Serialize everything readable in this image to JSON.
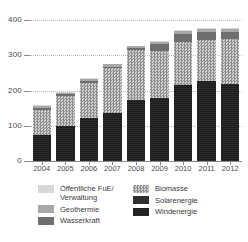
{
  "chart_data": {
    "type": "bar",
    "subtype": "stacked-bar",
    "title": "",
    "xlabel": "",
    "ylabel": "",
    "ylim": [
      0,
      400
    ],
    "yticks": [
      0,
      100,
      200,
      300,
      400
    ],
    "ytick_labels": [
      "0",
      "100",
      "200",
      "300",
      "400"
    ],
    "grid": true,
    "grid_style": "dotted horizontal",
    "legend_position": "bottom",
    "categories": [
      "2004",
      "2005",
      "2006",
      "2007",
      "2008",
      "2009",
      "2010",
      "2011",
      "2012"
    ],
    "series": [
      {
        "name": "Windenergie",
        "color": "#1c1c1c",
        "pattern": "solid-dark",
        "values": [
          73,
          100,
          122,
          136,
          174,
          180,
          217,
          227,
          219
        ]
      },
      {
        "name": "Solarenergie",
        "color": "#2f2f2f",
        "pattern": "solid",
        "values": [
          0,
          0,
          0,
          0,
          0,
          0,
          0,
          0,
          0
        ]
      },
      {
        "name": "Biomasse",
        "color": "#9a9a9a",
        "pattern": "checkered",
        "values": [
          72,
          85,
          100,
          127,
          141,
          131,
          122,
          117,
          126
        ]
      },
      {
        "name": "Wasserkraft",
        "color": "#6e6e6e",
        "pattern": "solid-medium",
        "values": [
          6,
          5,
          6,
          5,
          5,
          20,
          21,
          21,
          21
        ]
      },
      {
        "name": "Geothermie",
        "color": "#a8a8a8",
        "pattern": "solid-light",
        "values": [
          5,
          4,
          5,
          6,
          5,
          7,
          8,
          9,
          9
        ]
      },
      {
        "name": "Öffentliche FuE/Verwaltung",
        "color": "#d8d8d8",
        "pattern": "solid-lightest",
        "values": [
          2,
          2,
          2,
          2,
          2,
          2,
          3,
          3,
          3
        ]
      }
    ],
    "totals": [
      158,
      196,
      235,
      276,
      327,
      340,
      371,
      377,
      378
    ]
  },
  "legend": {
    "left_column": [
      {
        "label": "Öffentliche FuE/\nVerwaltung",
        "fill": "f-oeff",
        "icon": "legend-swatch"
      },
      {
        "label": "Geothermie",
        "fill": "f-geo",
        "icon": "legend-swatch"
      },
      {
        "label": "Wasserkraft",
        "fill": "f-wasser",
        "icon": "legend-swatch"
      }
    ],
    "right_column": [
      {
        "label": "Biomasse",
        "fill": "f-bio",
        "icon": "legend-swatch"
      },
      {
        "label": "Solarenergie",
        "fill": "f-solar",
        "icon": "legend-swatch"
      },
      {
        "label": "Windenergie",
        "fill": "f-wind",
        "icon": "legend-swatch"
      }
    ]
  },
  "colors": {
    "wind": "#1c1c1c",
    "solar": "#2f2f2f",
    "biomasse": "#9a9a9a",
    "wasserkraft": "#6e6e6e",
    "geothermie": "#a8a8a8",
    "oeffentliche": "#d8d8d8",
    "grid": "#b9b9b9",
    "axis": "#8a8a8a",
    "text": "#3a3a3a",
    "background": "#ffffff"
  }
}
